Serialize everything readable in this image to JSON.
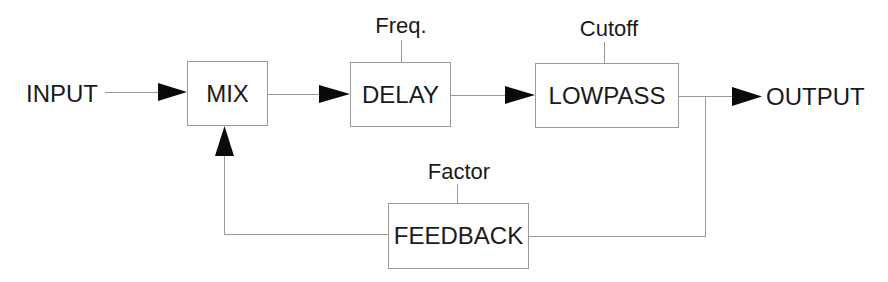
{
  "diagram": {
    "input_label": "INPUT",
    "output_label": "OUTPUT",
    "blocks": {
      "mix": {
        "label": "MIX"
      },
      "delay": {
        "label": "DELAY",
        "param": "Freq."
      },
      "lowpass": {
        "label": "LOWPASS",
        "param": "Cutoff"
      },
      "feedback": {
        "label": "FEEDBACK",
        "param": "Factor"
      }
    },
    "connections": [
      {
        "from": "INPUT",
        "to": "MIX"
      },
      {
        "from": "MIX",
        "to": "DELAY"
      },
      {
        "from": "DELAY",
        "to": "LOWPASS"
      },
      {
        "from": "LOWPASS",
        "to": "OUTPUT"
      },
      {
        "from": "LOWPASS",
        "to": "FEEDBACK"
      },
      {
        "from": "FEEDBACK",
        "to": "MIX"
      }
    ],
    "colors": {
      "line": "#9a9a9a",
      "arrow": "#0a0a0a",
      "text": "#1a1a1a",
      "background": "#ffffff"
    }
  }
}
